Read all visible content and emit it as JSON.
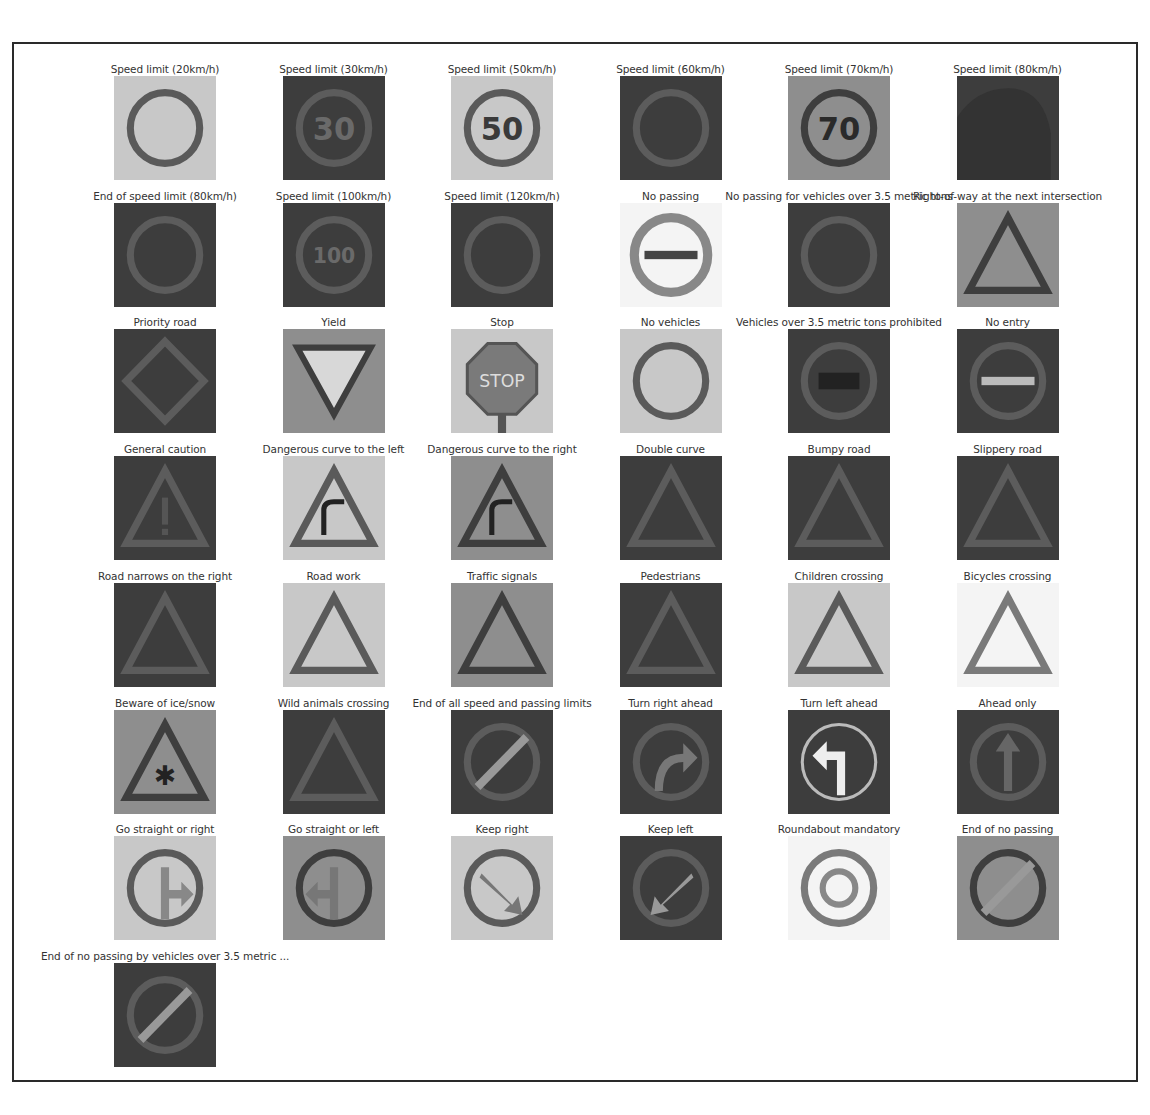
{
  "figure": {
    "grid": {
      "columns": 6,
      "rows": 8
    }
  },
  "chart_data": {
    "type": "table",
    "title": "",
    "layout": "image grid, 6 columns, one grayscale 32x32 sample per class with class-name caption",
    "grid_columns": 6,
    "count": 43,
    "items": [
      {
        "label": "Speed limit (20km/h)",
        "tone": "light",
        "shape": "circle",
        "glyph": ""
      },
      {
        "label": "Speed limit (30km/h)",
        "tone": "dark",
        "shape": "circle",
        "glyph": "30"
      },
      {
        "label": "Speed limit (50km/h)",
        "tone": "light",
        "shape": "circle",
        "glyph": "50"
      },
      {
        "label": "Speed limit (60km/h)",
        "tone": "dark",
        "shape": "circle",
        "glyph": ""
      },
      {
        "label": "Speed limit (70km/h)",
        "tone": "mid",
        "shape": "circle",
        "glyph": "70"
      },
      {
        "label": "Speed limit (80km/h)",
        "tone": "dark",
        "shape": "blob",
        "glyph": ""
      },
      {
        "label": "End of speed limit (80km/h)",
        "tone": "dark",
        "shape": "circle",
        "glyph": ""
      },
      {
        "label": "Speed limit (100km/h)",
        "tone": "dark",
        "shape": "circle",
        "glyph": "100"
      },
      {
        "label": "Speed limit (120km/h)",
        "tone": "dark",
        "shape": "circle",
        "glyph": ""
      },
      {
        "label": "No passing",
        "tone": "white",
        "shape": "ring",
        "glyph": "bar"
      },
      {
        "label": "No passing for vehicles over 3.5 metric tons",
        "tone": "dark",
        "shape": "circle",
        "glyph": ""
      },
      {
        "label": "Right-of-way at the next intersection",
        "tone": "mid",
        "shape": "triangle",
        "glyph": ""
      },
      {
        "label": "Priority road",
        "tone": "dark",
        "shape": "diamond",
        "glyph": ""
      },
      {
        "label": "Yield",
        "tone": "mid",
        "shape": "inv-triangle",
        "glyph": ""
      },
      {
        "label": "Stop",
        "tone": "light",
        "shape": "octagon",
        "glyph": "STOP"
      },
      {
        "label": "No vehicles",
        "tone": "light",
        "shape": "circle",
        "glyph": ""
      },
      {
        "label": "Vehicles over 3.5 metric tons prohibited",
        "tone": "dark",
        "shape": "circle",
        "glyph": "truck"
      },
      {
        "label": "No entry",
        "tone": "dark",
        "shape": "circle",
        "glyph": "bar"
      },
      {
        "label": "General caution",
        "tone": "dark",
        "shape": "triangle",
        "glyph": "!"
      },
      {
        "label": "Dangerous curve to the left",
        "tone": "light",
        "shape": "triangle",
        "glyph": "curve"
      },
      {
        "label": "Dangerous curve to the right",
        "tone": "mid",
        "shape": "triangle",
        "glyph": "curve"
      },
      {
        "label": "Double curve",
        "tone": "dark",
        "shape": "triangle",
        "glyph": ""
      },
      {
        "label": "Bumpy road",
        "tone": "dark",
        "shape": "triangle",
        "glyph": ""
      },
      {
        "label": "Slippery road",
        "tone": "dark",
        "shape": "triangle",
        "glyph": ""
      },
      {
        "label": "Road narrows on the right",
        "tone": "dark",
        "shape": "triangle",
        "glyph": ""
      },
      {
        "label": "Road work",
        "tone": "light",
        "shape": "triangle",
        "glyph": ""
      },
      {
        "label": "Traffic signals",
        "tone": "mid",
        "shape": "triangle",
        "glyph": ""
      },
      {
        "label": "Pedestrians",
        "tone": "dark",
        "shape": "triangle",
        "glyph": ""
      },
      {
        "label": "Children crossing",
        "tone": "light",
        "shape": "triangle",
        "glyph": ""
      },
      {
        "label": "Bicycles crossing",
        "tone": "white",
        "shape": "triangle",
        "glyph": ""
      },
      {
        "label": "Beware of ice/snow",
        "tone": "mid",
        "shape": "triangle",
        "glyph": "*"
      },
      {
        "label": "Wild animals crossing",
        "tone": "dark",
        "shape": "triangle",
        "glyph": ""
      },
      {
        "label": "End of all speed and passing limits",
        "tone": "dark",
        "shape": "circle",
        "glyph": "slash"
      },
      {
        "label": "Turn right ahead",
        "tone": "dark",
        "shape": "circle",
        "glyph": "right"
      },
      {
        "label": "Turn left ahead",
        "tone": "dark",
        "shape": "ring",
        "glyph": "left"
      },
      {
        "label": "Ahead only",
        "tone": "dark",
        "shape": "circle",
        "glyph": "up"
      },
      {
        "label": "Go straight or right",
        "tone": "light",
        "shape": "circle",
        "glyph": "up-right"
      },
      {
        "label": "Go straight or left",
        "tone": "mid",
        "shape": "circle",
        "glyph": "up-left"
      },
      {
        "label": "Keep right",
        "tone": "light",
        "shape": "circle",
        "glyph": "down-right"
      },
      {
        "label": "Keep left",
        "tone": "dark",
        "shape": "circle",
        "glyph": "down-left"
      },
      {
        "label": "Roundabout mandatory",
        "tone": "white",
        "shape": "circle",
        "glyph": "round"
      },
      {
        "label": "End of no passing",
        "tone": "mid",
        "shape": "circle",
        "glyph": "slash"
      },
      {
        "label": "End of no passing by vehicles over 3.5 metric ...",
        "tone": "dark",
        "shape": "circle",
        "glyph": "slash"
      }
    ]
  }
}
